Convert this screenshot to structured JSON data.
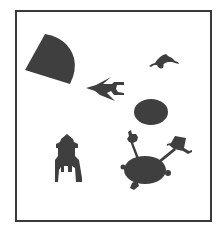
{
  "figure": {
    "colors": {
      "background": "#ffffff",
      "frame": "#3a3a3a",
      "shape_fill": "#3f3f3f"
    },
    "shapes": [
      {
        "name": "quarter-circle-shape",
        "kind": "wedge"
      },
      {
        "name": "bird-shape",
        "kind": "swallow"
      },
      {
        "name": "creature-shape",
        "kind": "small crawling figure"
      },
      {
        "name": "oval-shape",
        "kind": "ellipse"
      },
      {
        "name": "tower-shape",
        "kind": "house/tower"
      },
      {
        "name": "blob-with-arms-shape",
        "kind": "body with limbs"
      }
    ]
  }
}
